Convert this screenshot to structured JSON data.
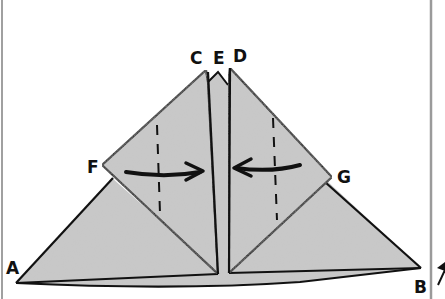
{
  "diagram": {
    "type": "origami-fold-instruction",
    "labels": {
      "C": "C",
      "E": "E",
      "D": "D",
      "F": "F",
      "G": "G",
      "A": "A",
      "B": "B"
    },
    "arrows": [
      {
        "name": "fold-arrow-left",
        "direction": "right"
      },
      {
        "name": "fold-arrow-right",
        "direction": "left"
      }
    ],
    "fold_lines": [
      {
        "name": "valley-fold-line-left",
        "style": "dashed"
      },
      {
        "name": "valley-fold-line-right",
        "style": "dashed"
      }
    ],
    "colors": {
      "paper": "#c9c9c9",
      "outline": "#111111",
      "frame": "#9a9a9a",
      "background": "#ffffff"
    }
  }
}
